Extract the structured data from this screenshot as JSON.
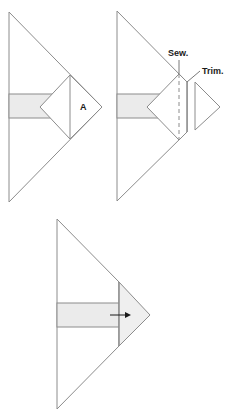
{
  "diagram": {
    "colors": {
      "line": "#8c8c8c",
      "strip_fill": "#ebebeb",
      "pressed_fill": "#efefef",
      "label": "#1a1a1a"
    },
    "panels": [
      {
        "id": "step-1",
        "labels": {
          "a": "A"
        }
      },
      {
        "id": "step-2",
        "labels": {
          "sew": "Sew.",
          "trim": "Trim."
        }
      },
      {
        "id": "step-3",
        "labels": {},
        "arrow": "right-arrow"
      }
    ]
  }
}
